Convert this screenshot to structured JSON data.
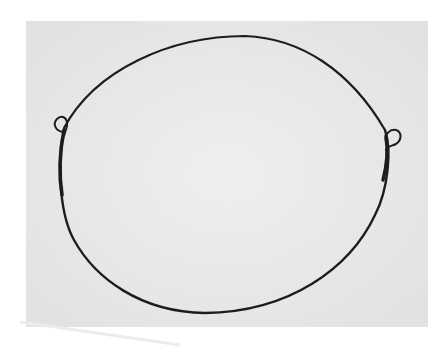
{
  "image": {
    "description": "Photograph of a thin dark wire bent into an oval loop with two small eyelet loops at left and right, lying on a light gray paper background",
    "colors": {
      "page_background": "#ffffff",
      "paper": "#e9e9e9",
      "paper_shadow": "#dcdcdc",
      "wire": "#1e1e1e"
    },
    "paper_rect": {
      "x": 26,
      "y": 21,
      "width": 402,
      "height": 306
    },
    "loop": {
      "cx": 220,
      "cy": 176,
      "rx": 160,
      "ry": 140
    },
    "eyelets": [
      {
        "side": "left",
        "cx": 60,
        "cy": 123
      },
      {
        "side": "right",
        "cx": 396,
        "cy": 137
      }
    ]
  }
}
